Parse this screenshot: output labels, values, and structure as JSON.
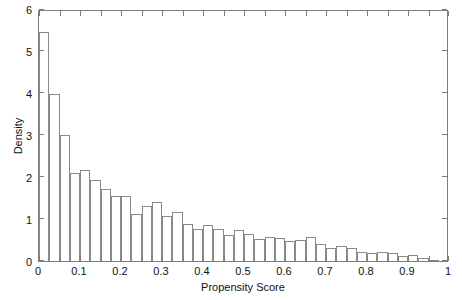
{
  "chart_data": {
    "type": "bar",
    "title": "",
    "xlabel": "Propensity Score",
    "ylabel": "Density",
    "xlim": [
      0,
      1
    ],
    "ylim": [
      0,
      6
    ],
    "grid": false,
    "legend": null,
    "bin_width": 0.025,
    "bin_edges": [
      0,
      0.025,
      0.05,
      0.075,
      0.1,
      0.125,
      0.15,
      0.175,
      0.2,
      0.225,
      0.25,
      0.275,
      0.3,
      0.325,
      0.35,
      0.375,
      0.4,
      0.425,
      0.45,
      0.475,
      0.5,
      0.525,
      0.55,
      0.575,
      0.6,
      0.625,
      0.65,
      0.675,
      0.7,
      0.725,
      0.75,
      0.775,
      0.8,
      0.825,
      0.85,
      0.875,
      0.9,
      0.925,
      0.95,
      0.975,
      1.0
    ],
    "categories": [
      "0.0125",
      "0.0375",
      "0.0625",
      "0.0875",
      "0.1125",
      "0.1375",
      "0.1625",
      "0.1875",
      "0.2125",
      "0.2375",
      "0.2625",
      "0.2875",
      "0.3125",
      "0.3375",
      "0.3625",
      "0.3875",
      "0.4125",
      "0.4375",
      "0.4625",
      "0.4875",
      "0.5125",
      "0.5375",
      "0.5625",
      "0.5875",
      "0.6125",
      "0.6375",
      "0.6625",
      "0.6875",
      "0.7125",
      "0.7375",
      "0.7625",
      "0.7875",
      "0.8125",
      "0.8375",
      "0.8625",
      "0.8875",
      "0.9125",
      "0.9375",
      "0.9625",
      "0.9875"
    ],
    "values": [
      5.45,
      3.98,
      2.99,
      2.09,
      2.16,
      1.92,
      1.72,
      1.54,
      1.54,
      1.12,
      1.3,
      1.4,
      1.07,
      1.16,
      0.88,
      0.76,
      0.85,
      0.76,
      0.62,
      0.74,
      0.64,
      0.52,
      0.57,
      0.54,
      0.48,
      0.5,
      0.58,
      0.41,
      0.3,
      0.35,
      0.32,
      0.21,
      0.2,
      0.22,
      0.18,
      0.13,
      0.14,
      0.08,
      0.03,
      0.0
    ],
    "xticks": [
      0,
      0.1,
      0.2,
      0.3,
      0.4,
      0.5,
      0.6,
      0.7,
      0.8,
      0.9,
      1
    ],
    "xticklabels": [
      "0",
      "0.1",
      "0.2",
      "0.3",
      "0.4",
      "0.5",
      "0.6",
      "0.7",
      "0.8",
      "0.9",
      "1"
    ],
    "xminorticks": [
      0.05,
      0.15,
      0.25,
      0.35,
      0.45,
      0.55,
      0.65,
      0.75,
      0.85,
      0.95
    ],
    "yticks": [
      0,
      1,
      2,
      3,
      4,
      5,
      6
    ],
    "yticklabels": [
      "0",
      "1",
      "2",
      "3",
      "4",
      "5",
      "6"
    ],
    "colors": {
      "bar_edge": "#8a8a8a",
      "bar_fill": "#ffffff",
      "axis": "#7d7d7d",
      "text": "#111111",
      "background": "#ffffff"
    }
  }
}
